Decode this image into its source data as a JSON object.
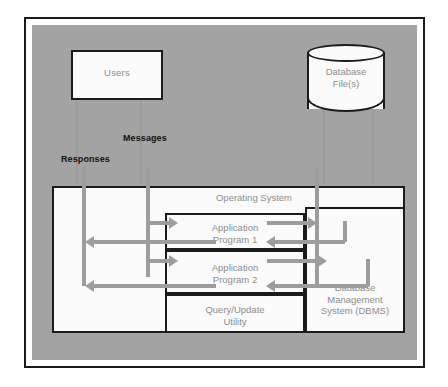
{
  "diagram": {
    "title_label": "Main Memory",
    "entities": {
      "users": "Users",
      "database_file": "Database\nFile(s)",
      "database_file_line1": "Database",
      "database_file_line2": "File(s)"
    },
    "flows": {
      "messages": "Messages",
      "responses": "Responses"
    },
    "main_memory": {
      "operating_system": "Operating System",
      "app1_line1": "Application",
      "app1_line2": "Program 1",
      "app2_line1": "Application",
      "app2_line2": "Program 2",
      "query_line1": "Query/Update",
      "query_line2": "Utility",
      "dbms_line1": "Database",
      "dbms_line2": "Management",
      "dbms_line3": "System (DBMS)"
    }
  },
  "colors": {
    "panel_gray": "#a3a3a3",
    "box_fill": "#fbfbfb",
    "border_black": "#1b1b1b",
    "arrow_gray": "#9d9d9d",
    "label_gray": "#8d8d8d",
    "label_black": "#111111"
  }
}
